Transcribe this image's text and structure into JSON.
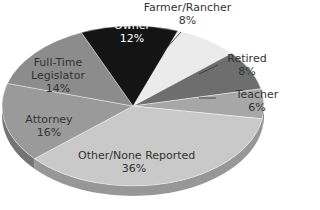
{
  "chart_data": {
    "type": "pie",
    "style": "3d-pie",
    "title": "",
    "slices": [
      {
        "label": "Farmer/Rancher",
        "value": 8,
        "display": "8%",
        "color": "#ebebeb"
      },
      {
        "label": "Retired",
        "value": 8,
        "display": "8%",
        "color": "#6e6e6e"
      },
      {
        "label": "Teacher",
        "value": 6,
        "display": "6%",
        "color": "#a7a7a7"
      },
      {
        "label": "Other/None Reported",
        "value": 36,
        "display": "36%",
        "color": "#c9c9c9"
      },
      {
        "label": "Attorney",
        "value": 16,
        "display": "16%",
        "color": "#9a9a9a"
      },
      {
        "label": "Full-Time Legislator",
        "value": 14,
        "display": "14%",
        "color": "#8c8c8c"
      },
      {
        "label": "Business Owner",
        "value": 12,
        "display": "12%",
        "color": "#141414"
      }
    ],
    "start_angle_deg": -70,
    "legend": "none (direct labels)"
  },
  "labels": {
    "business_owner": {
      "line1": "Business",
      "line2": "Owner",
      "pct": "12%"
    },
    "farmer": {
      "line1": "Farmer/Rancher",
      "pct": "8%"
    },
    "retired": {
      "line1": "Retired",
      "pct": "8%"
    },
    "teacher": {
      "line1": "Teacher",
      "pct": "6%"
    },
    "legislator": {
      "line1": "Full-Time",
      "line2": "Legislator",
      "pct": "14%"
    },
    "attorney": {
      "line1": "Attorney",
      "pct": "16%"
    },
    "other": {
      "line1": "Other/None Reported",
      "pct": "36%"
    }
  }
}
